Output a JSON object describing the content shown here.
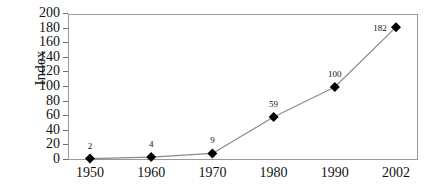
{
  "chart_data": {
    "type": "line",
    "title": "",
    "xlabel": "",
    "ylabel": "Index",
    "categories": [
      "1950",
      "1960",
      "1970",
      "1980",
      "1990",
      "2002"
    ],
    "values": [
      2,
      4,
      9,
      59,
      100,
      182
    ],
    "point_labels": [
      "2",
      "4",
      "9",
      "59",
      "100",
      "182"
    ],
    "ylim": [
      0,
      200
    ],
    "ytick_step": 20,
    "yticks": [
      0,
      20,
      40,
      60,
      80,
      100,
      120,
      140,
      160,
      180,
      200
    ],
    "ytick_labels": [
      "0",
      "20",
      "40",
      "60",
      "80",
      "100",
      "120",
      "140",
      "160",
      "180",
      "200"
    ],
    "grid": false,
    "legend": false,
    "legend_position": "none",
    "marker": "diamond",
    "marker_color": "#000000",
    "line_color": "#8a8a8a",
    "axis_color": "#9a9a9a",
    "background": "#ffffff",
    "text_color": "#111111"
  }
}
